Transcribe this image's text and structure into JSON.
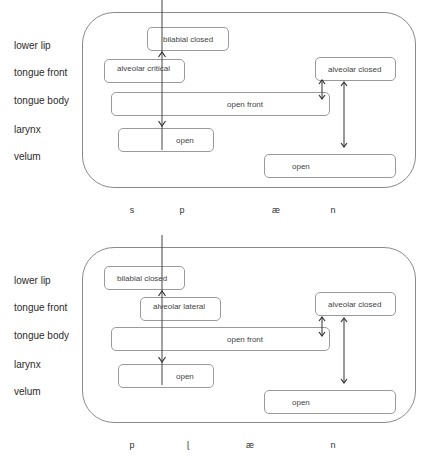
{
  "panels": [
    {
      "row_labels": [
        "lower lip",
        "tongue front",
        "tongue body",
        "larynx",
        "velum"
      ],
      "gestures": {
        "lower_lip": "bilabial closed",
        "tongue_front_1": "alveolar critical",
        "tongue_front_2": "alveolar closed",
        "tongue_body": "open front",
        "larynx": "open",
        "velum": "open"
      },
      "phonemes": [
        "s",
        "p",
        "æ",
        "n"
      ]
    },
    {
      "row_labels": [
        "lower lip",
        "tongue front",
        "tongue body",
        "larynx",
        "velum"
      ],
      "gestures": {
        "lower_lip": "bilabial closed",
        "tongue_front_1": "alveolar lateral",
        "tongue_front_2": "alveolar closed",
        "tongue_body": "open front",
        "larynx": "open",
        "velum": "open"
      },
      "phonemes": [
        "p",
        "ɭ",
        "æ",
        "n"
      ]
    }
  ],
  "colors": {
    "frame": "#8a8a8a",
    "box_border": "#9a9a9a",
    "arrow": "#333333",
    "text": "#2b2b2b"
  }
}
